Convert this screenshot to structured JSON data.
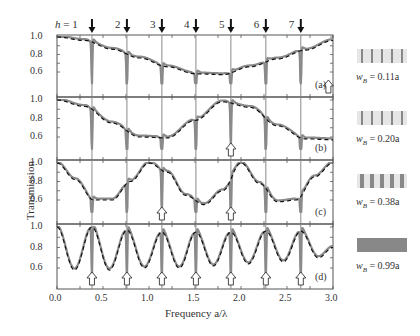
{
  "chart_data": {
    "type": "line",
    "title": "",
    "xlabel": "Frequency a/λ",
    "ylabel": "Transmission",
    "xlim": [
      0.0,
      3.0
    ],
    "x_ticks": [
      "0.0",
      "0.5",
      "1.0",
      "1.5",
      "2.0",
      "2.5",
      "3.0"
    ],
    "y_ticks": [
      "0.6",
      "0.8",
      "1.0"
    ],
    "resonance_markers": {
      "labels": [
        "h = 1",
        "2",
        "3",
        "4",
        "5",
        "6",
        "7"
      ],
      "x": [
        0.38,
        0.76,
        1.14,
        1.51,
        1.89,
        2.27,
        2.65
      ]
    },
    "panels": [
      {
        "tag": "(a)",
        "w_label": "w",
        "w_sub": "B",
        "w_value": " = 0.11a",
        "bar_fraction": 0.11,
        "ylim": [
          0.5,
          1.0
        ],
        "open_arrows_x": [
          2.95
        ],
        "dashed_envelope": {
          "x": [
            0.0,
            0.3,
            0.6,
            0.9,
            1.2,
            1.5,
            1.8,
            2.1,
            2.4,
            2.7,
            3.0
          ],
          "y": [
            1.0,
            0.96,
            0.86,
            0.76,
            0.66,
            0.58,
            0.57,
            0.66,
            0.75,
            0.85,
            0.96
          ]
        },
        "series_note": "simulated transmission (grey) with sharp Fano dips at resonances h=1..7"
      },
      {
        "tag": "(b)",
        "w_label": "w",
        "w_sub": "B",
        "w_value": " = 0.20a",
        "bar_fraction": 0.2,
        "ylim": [
          0.5,
          1.0
        ],
        "open_arrows_x": [
          1.89
        ],
        "dashed_envelope": {
          "x": [
            0.0,
            0.3,
            0.6,
            0.9,
            1.2,
            1.5,
            1.8,
            2.1,
            2.4,
            2.7,
            3.0
          ],
          "y": [
            1.0,
            0.93,
            0.75,
            0.6,
            0.59,
            0.78,
            0.98,
            0.92,
            0.72,
            0.58,
            0.57
          ]
        }
      },
      {
        "tag": "(c)",
        "w_label": "w",
        "w_sub": "B",
        "w_value": " = 0.38a",
        "bar_fraction": 0.38,
        "ylim": [
          0.5,
          1.0
        ],
        "open_arrows_x": [
          1.14,
          1.89
        ],
        "dashed_envelope": {
          "x": [
            0.0,
            0.2,
            0.4,
            0.6,
            0.8,
            1.0,
            1.2,
            1.4,
            1.6,
            1.8,
            2.0,
            2.2,
            2.4,
            2.6,
            2.8,
            3.0
          ],
          "y": [
            1.0,
            0.82,
            0.6,
            0.6,
            0.8,
            1.0,
            0.9,
            0.65,
            0.55,
            0.7,
            1.0,
            0.78,
            0.58,
            0.6,
            0.85,
            1.0
          ]
        }
      },
      {
        "tag": "(d)",
        "w_label": "w",
        "w_sub": "B",
        "w_value": " = 0.99a",
        "bar_fraction": 0.99,
        "ylim": [
          0.5,
          1.0
        ],
        "open_arrows_x": [
          0.38,
          0.76,
          1.14,
          1.51,
          1.89,
          2.27,
          2.65
        ],
        "dashed_envelope": {
          "x": [
            0.0,
            0.19,
            0.38,
            0.57,
            0.76,
            0.95,
            1.14,
            1.33,
            1.51,
            1.7,
            1.89,
            2.08,
            2.27,
            2.46,
            2.65,
            2.84,
            3.0
          ],
          "y": [
            1.0,
            0.58,
            1.0,
            0.58,
            0.97,
            0.6,
            0.95,
            0.6,
            0.95,
            0.62,
            0.95,
            0.64,
            0.96,
            0.66,
            0.96,
            0.7,
            0.8
          ]
        }
      }
    ],
    "legend": "none (structures depicted at right of each panel)",
    "grid": false
  }
}
